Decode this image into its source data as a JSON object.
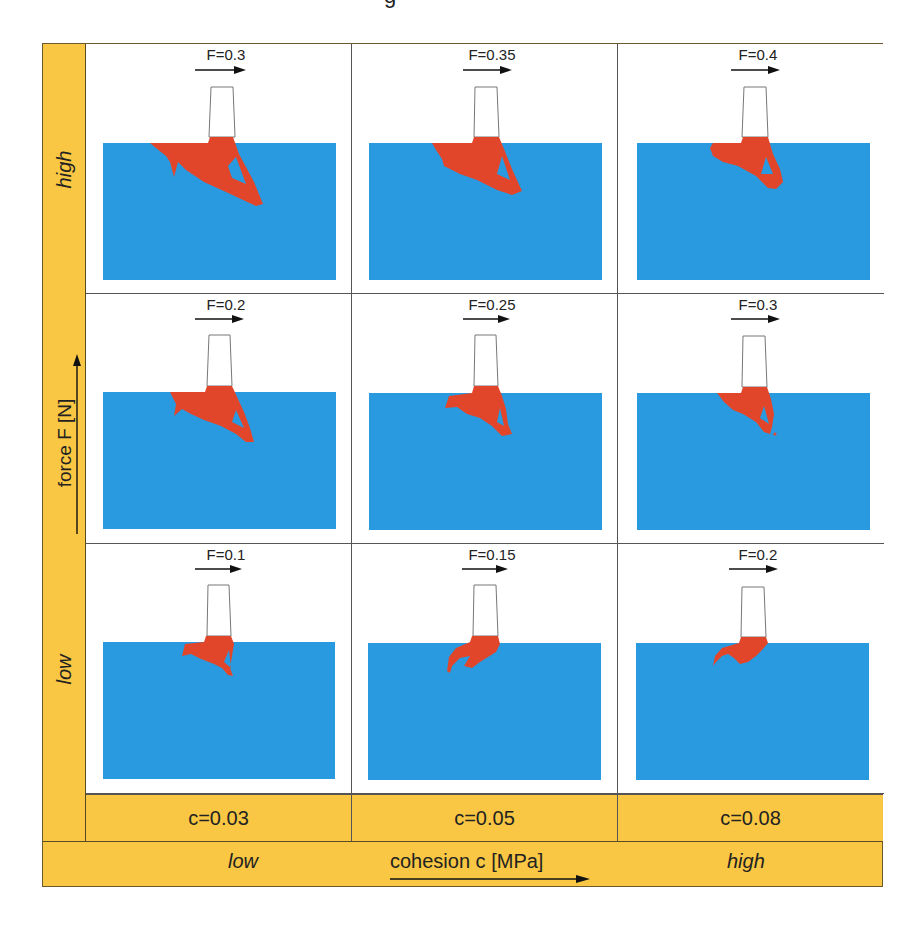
{
  "figure": {
    "title_fragment": "g",
    "colors": {
      "frame_yellow": "#f9c743",
      "rock_blue": "#2a9ae0",
      "fracture_red": "#e2462a",
      "tool_outline": "#777777",
      "border": "#555555"
    },
    "y_axis": {
      "label": "force F [N]",
      "high_label": "high",
      "low_label": "low",
      "arrow": "up-arrow"
    },
    "x_axis": {
      "label": "cohesion c [MPa]",
      "low_label": "low",
      "high_label": "high",
      "arrow": "right-arrow"
    },
    "columns": [
      {
        "cohesion_label": "c=0.03"
      },
      {
        "cohesion_label": "c=0.05"
      },
      {
        "cohesion_label": "c=0.08"
      }
    ],
    "rows": [
      {
        "level": "high",
        "cells": [
          {
            "force_label": "F=0.3"
          },
          {
            "force_label": "F=0.35"
          },
          {
            "force_label": "F=0.4"
          }
        ]
      },
      {
        "level": "mid",
        "cells": [
          {
            "force_label": "F=0.2"
          },
          {
            "force_label": "F=0.25"
          },
          {
            "force_label": "F=0.3"
          }
        ]
      },
      {
        "level": "low",
        "cells": [
          {
            "force_label": "F=0.1"
          },
          {
            "force_label": "F=0.15"
          },
          {
            "force_label": "F=0.2"
          }
        ]
      }
    ]
  }
}
